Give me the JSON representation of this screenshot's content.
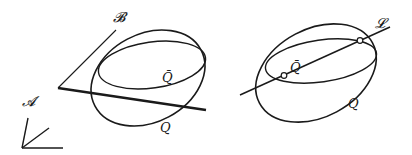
{
  "figure": {
    "left": {
      "labels": {
        "plane_B": "𝓑",
        "axes_A": "𝓐",
        "quadric_bar": "Q̄",
        "quadric": "Q"
      },
      "elements": [
        "axes A (three rays from common origin)",
        "line B (thin)",
        "thick line (plane trace)",
        "outer ellipse Q",
        "inner ellipse Q-bar"
      ]
    },
    "right": {
      "labels": {
        "line_L": "𝓛",
        "quadric_bar": "Q̄",
        "quadric": "Q"
      },
      "elements": [
        "outer ellipse Q",
        "inner ellipse Q-bar",
        "line L",
        "two intersection points (open circles)"
      ]
    },
    "colors": {
      "ink": "#1a1a1a",
      "background": "#ffffff"
    }
  }
}
